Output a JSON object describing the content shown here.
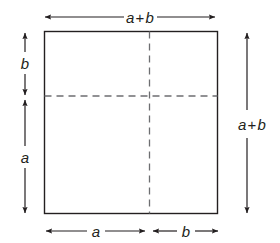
{
  "figure": {
    "type": "geometry-diagram",
    "background_color": "#ffffff",
    "stroke_color": "#231f20",
    "dashed_color": "#6d6e71"
  },
  "labels": {
    "top": {
      "lead": "a",
      "op": "+",
      "trail": "b",
      "full": "a + b"
    },
    "right": {
      "lead": "a",
      "op": "+",
      "trail": "b",
      "full": "a + b"
    },
    "left_upper": "b",
    "left_lower": "a",
    "bottom_left": "a",
    "bottom_right": "b"
  },
  "geometry": {
    "square": {
      "x": 44,
      "y": 31,
      "width": 174,
      "height": 183
    },
    "vertical_dashed_x": 149,
    "horizontal_dashed_y": 96,
    "top_arrow": {
      "y": 17,
      "x1": 45,
      "x2": 215
    },
    "right_arrow": {
      "x": 247,
      "y1": 33,
      "y2": 213
    },
    "left_arrow_b": {
      "x": 25,
      "y1": 33,
      "y2": 95
    },
    "left_arrow_a": {
      "x": 25,
      "y1": 100,
      "y2": 213
    },
    "bottom_arrow_a": {
      "y": 231,
      "x1": 46,
      "x2": 145
    },
    "bottom_arrow_b": {
      "y": 231,
      "x1": 153,
      "x2": 218
    }
  }
}
